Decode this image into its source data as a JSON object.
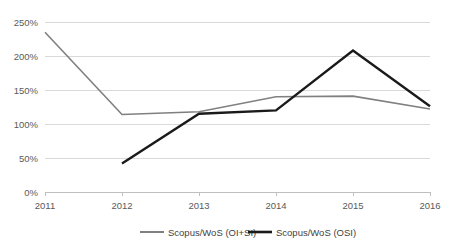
{
  "chart_data": {
    "type": "line",
    "title": "",
    "subtitle": "",
    "xlabel": "",
    "ylabel": "",
    "categories": [
      "2011",
      "2012",
      "2013",
      "2014",
      "2015",
      "2016"
    ],
    "x_tick_labels": [
      "2011",
      "2012",
      "2013",
      "2014",
      "2015",
      "2016"
    ],
    "y_tick_labels": [
      "0%",
      "50%",
      "100%",
      "150%",
      "200%",
      "250%"
    ],
    "y_tick_values": [
      0,
      50,
      100,
      150,
      200,
      250
    ],
    "ylim": [
      0,
      250
    ],
    "y_unit": "%",
    "grid": "horizontal",
    "legend_position": "bottom",
    "series": [
      {
        "name": "Scopus/WoS (OI+SI)",
        "color": "#808080",
        "values": [
          235,
          114,
          118,
          140,
          141,
          122
        ]
      },
      {
        "name": "Scopus/WoS (OSI)",
        "color": "#1a1a1a",
        "values": [
          null,
          42,
          115,
          120,
          208,
          126
        ]
      }
    ],
    "legend": [
      {
        "label": "Scopus/WoS (OI+SI)",
        "color": "#808080",
        "marker": "line-swatch"
      },
      {
        "label": "Scopus/WoS (OSI)",
        "color": "#1a1a1a",
        "marker": "line-swatch"
      }
    ],
    "colors": {
      "background": "#ffffff",
      "gridline": "#d9d9d9",
      "axis": "#bfbfbf",
      "tick_text": "#5a5a5a",
      "legend_text": "#3f3f3f"
    }
  }
}
